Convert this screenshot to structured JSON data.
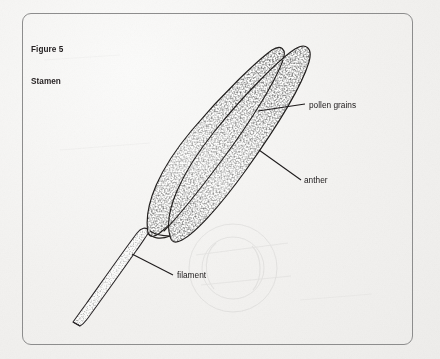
{
  "figure": {
    "caption_line1": "Figure 5",
    "caption_line2": "Stamen",
    "subject": "stamen",
    "border_color": "#8d8d8d",
    "ink_color": "#1d1a1b",
    "paper_color": "#f3f2f0"
  },
  "labels": {
    "pollen_grains": "pollen grains",
    "anther": "anther",
    "filament": "filament"
  },
  "diagram": {
    "type": "botanical-line-drawing",
    "parts": [
      {
        "name": "anther",
        "description": "elongated two-lobed pollen sac, stippled, angled from lower-left to upper-right"
      },
      {
        "name": "pollen grains",
        "description": "fine stipple dots covering the anther surface"
      },
      {
        "name": "filament",
        "description": "slender tapering stalk descending to the lower-left"
      }
    ],
    "leader_lines": [
      {
        "label": "pollen grains",
        "from_x": 258,
        "from_y": 111,
        "to_x": 305,
        "to_y": 104
      },
      {
        "label": "anther",
        "from_x": 259,
        "from_y": 150,
        "to_x": 301,
        "to_y": 180
      },
      {
        "label": "filament",
        "from_x": 132,
        "from_y": 254,
        "to_x": 173,
        "to_y": 275
      }
    ]
  }
}
